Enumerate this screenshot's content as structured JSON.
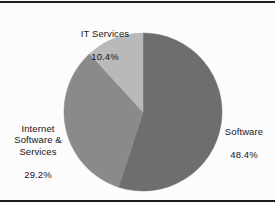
{
  "figure": {
    "background_color": "#fcfcfc",
    "border_color": "#1d1d1d",
    "label_color": "#161616"
  },
  "chart_data": {
    "type": "pie",
    "title": "",
    "subtitle": "",
    "xlabel": "",
    "ylabel": "",
    "legend_position": "none",
    "grid": false,
    "labels_outside": true,
    "start_angle_deg": 0,
    "direction": "clockwise",
    "categories": [
      "Software",
      "Internet Software & Services",
      "IT Services"
    ],
    "values": [
      48.4,
      29.2,
      10.4
    ],
    "value_suffix": "%",
    "colors": [
      "#6e6e6e",
      "#8a8a8a",
      "#b9b9b9"
    ],
    "slices": [
      {
        "name": "Software",
        "value": 48.4,
        "value_text": "48.4%",
        "color": "#6e6e6e",
        "label_position": "right"
      },
      {
        "name": "Internet\nSoftware &\nServices",
        "value": 29.2,
        "value_text": "29.2%",
        "color": "#8a8a8a",
        "label_position": "left"
      },
      {
        "name": "IT Services",
        "value": 10.4,
        "value_text": "10.4%",
        "color": "#b9b9b9",
        "label_position": "top"
      }
    ]
  },
  "labels": {
    "it_services": {
      "name": "IT Services",
      "value": "10.4%"
    },
    "internet_software_services": {
      "name": "Internet\nSoftware &\nServices",
      "value": "29.2%"
    },
    "software": {
      "name": "Software",
      "value": "48.4%"
    }
  }
}
